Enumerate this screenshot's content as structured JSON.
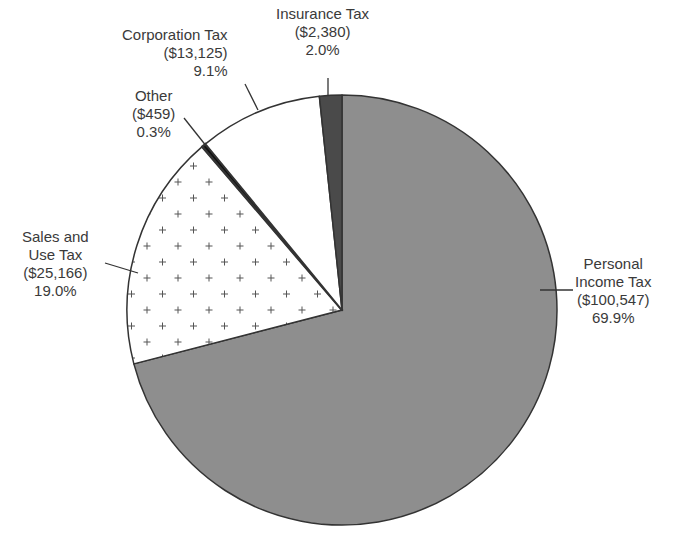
{
  "chart_data": {
    "type": "pie",
    "title": "",
    "start_angle_deg": 0,
    "direction": "clockwise",
    "slices": [
      {
        "name": "Personal Income Tax",
        "amount": "$100,547",
        "value": 100547,
        "percent": 69.9,
        "fill": "#8e8e8e",
        "pattern": "solid"
      },
      {
        "name": "Sales and Use Tax",
        "amount": "$25,166",
        "value": 25166,
        "percent": 19.0,
        "fill": "#ffffff",
        "pattern": "plus"
      },
      {
        "name": "Other",
        "amount": "$459",
        "value": 459,
        "percent": 0.3,
        "fill": "#111111",
        "pattern": "solid"
      },
      {
        "name": "Corporation Tax",
        "amount": "$13,125",
        "value": 13125,
        "percent": 9.1,
        "fill": "#ffffff",
        "pattern": "solid"
      },
      {
        "name": "Insurance Tax",
        "amount": "$2,380",
        "value": 2380,
        "percent": 2.0,
        "fill": "#4a4a4a",
        "pattern": "solid"
      }
    ]
  },
  "labels": {
    "personal": {
      "line1": "Personal",
      "line2": "Income Tax",
      "amount": "($100,547)",
      "percent": "69.9%"
    },
    "sales": {
      "line1": "Sales and",
      "line2": "Use Tax",
      "amount": "($25,166)",
      "percent": "19.0%"
    },
    "other": {
      "line1": "Other",
      "amount": "($459)",
      "percent": "0.3%"
    },
    "corporation": {
      "line1": "Corporation Tax",
      "amount": "($13,125)",
      "percent": "9.1%"
    },
    "insurance": {
      "line1": "Insurance Tax",
      "amount": "($2,380)",
      "percent": "2.0%"
    }
  }
}
